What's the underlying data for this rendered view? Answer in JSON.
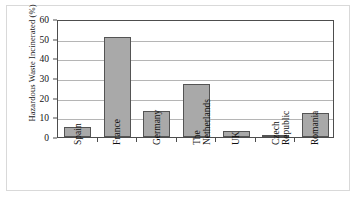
{
  "chart_data": {
    "type": "bar",
    "title": "",
    "xlabel": "",
    "ylabel": "Hazardous Waste Incinerated (%)",
    "categories": [
      "Spain",
      "France",
      "Germany",
      "The\nNetherlands",
      "UK",
      "Czech\nRepublic",
      "Romania"
    ],
    "values": [
      5,
      51,
      13,
      27,
      3,
      1,
      12
    ],
    "ylim": [
      0,
      60
    ],
    "yticks": [
      0,
      10,
      20,
      30,
      40,
      50,
      60
    ],
    "ytick_labels": [
      "0",
      "10",
      "20",
      "30",
      "40",
      "50",
      "60"
    ],
    "grid": "horizontal",
    "legend": "none",
    "bar_color": "#a9a9a9",
    "bar_edge_color": "#545454",
    "axis_color": "#4d4d4d",
    "gridline_color": "#b5b5b5"
  }
}
